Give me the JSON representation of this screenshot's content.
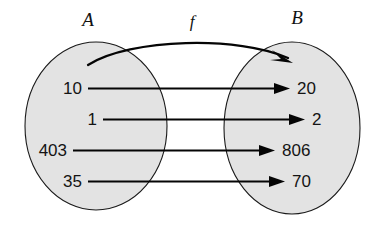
{
  "diagram": {
    "type": "function-mapping",
    "title": "",
    "background_color": "#ffffff",
    "set_fill_color": "#e3e3e3",
    "set_stroke_color": "#1a1a1a",
    "arrow_color": "#050505",
    "text_color": "#141414",
    "domain_set": {
      "name": "A",
      "elements": [
        "10",
        "1",
        "403",
        "35"
      ]
    },
    "codomain_set": {
      "name": "B",
      "elements": [
        "20",
        "2",
        "806",
        "70"
      ]
    },
    "function": {
      "name": "f",
      "mappings": [
        {
          "from": "10",
          "to": "20"
        },
        {
          "from": "1",
          "to": "2"
        },
        {
          "from": "403",
          "to": "806"
        },
        {
          "from": "35",
          "to": "70"
        }
      ]
    },
    "overview_arrow": {
      "label": "f",
      "description": "curved arrow from set A to set B"
    }
  }
}
